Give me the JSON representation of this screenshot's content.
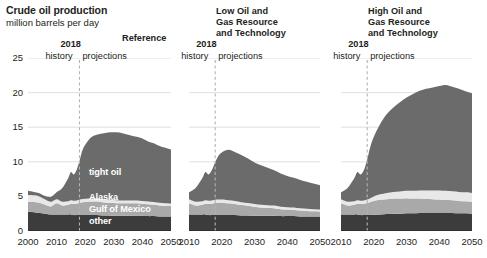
{
  "header": {
    "title": "Crude oil production",
    "subtitle": "million barrels per day"
  },
  "annotations": {
    "year_label": "2018",
    "history_label": "history",
    "projections_label": "projections"
  },
  "series_labels": {
    "tight_oil": "tight oil",
    "alaska": "Alaska",
    "gulf_of_mexico": "Gulf of Mexico",
    "other": "other"
  },
  "colors": {
    "tight_oil": "#6b6b6b",
    "alaska": "#e8e8e8",
    "gulf_of_mexico": "#a9a9a9",
    "other": "#3c3c3c",
    "axis": "#231f20",
    "gridline": "#d8d8d8",
    "divider": "#b4b4b4",
    "label_text": "#231f20",
    "series_label_text": "#ffffff"
  },
  "chart_data": [
    {
      "type": "area",
      "panel": "reference",
      "title": "Reference",
      "xlabel": "",
      "ylabel": "million barrels per day",
      "grid": true,
      "legend": "inline-series-labels",
      "xlim": [
        2000,
        2050
      ],
      "ylim": [
        0,
        25
      ],
      "xticks": [
        2000,
        2010,
        2020,
        2030,
        2040,
        2050
      ],
      "yticks": [
        0,
        5,
        10,
        15,
        20,
        25
      ],
      "divider_x": 2018,
      "stack_order": [
        "other",
        "gulf_of_mexico",
        "alaska",
        "tight_oil"
      ],
      "x": [
        2000,
        2002,
        2004,
        2006,
        2008,
        2010,
        2012,
        2014,
        2015,
        2016,
        2017,
        2018,
        2019,
        2020,
        2022,
        2024,
        2026,
        2028,
        2030,
        2032,
        2034,
        2036,
        2038,
        2040,
        2042,
        2044,
        2046,
        2048,
        2050
      ],
      "series": [
        {
          "name": "other",
          "values": [
            2.8,
            2.7,
            2.6,
            2.5,
            2.4,
            2.4,
            2.4,
            2.4,
            2.4,
            2.3,
            2.3,
            2.3,
            2.3,
            2.3,
            2.3,
            2.3,
            2.25,
            2.25,
            2.2,
            2.2,
            2.2,
            2.2,
            2.2,
            2.2,
            2.15,
            2.15,
            2.1,
            2.1,
            2.1
          ]
        },
        {
          "name": "gulf_of_mexico",
          "values": [
            1.4,
            1.5,
            1.5,
            1.3,
            1.15,
            1.6,
            1.3,
            1.4,
            1.55,
            1.6,
            1.65,
            1.75,
            1.85,
            1.9,
            1.95,
            1.95,
            1.9,
            1.85,
            1.85,
            1.8,
            1.8,
            1.8,
            1.8,
            1.75,
            1.7,
            1.65,
            1.6,
            1.55,
            1.5
          ]
        },
        {
          "name": "alaska",
          "values": [
            1.0,
            0.95,
            0.9,
            0.75,
            0.68,
            0.6,
            0.53,
            0.5,
            0.48,
            0.48,
            0.47,
            0.47,
            0.47,
            0.47,
            0.46,
            0.45,
            0.45,
            0.44,
            0.43,
            0.42,
            0.42,
            0.41,
            0.41,
            0.4,
            0.4,
            0.39,
            0.38,
            0.37,
            0.37
          ]
        },
        {
          "name": "tight_oil",
          "values": [
            0.6,
            0.5,
            0.45,
            0.5,
            0.7,
            1.0,
            2.0,
            3.3,
            4.1,
            3.8,
            4.4,
            5.6,
            7.0,
            7.8,
            8.8,
            9.2,
            9.5,
            9.7,
            9.8,
            9.8,
            9.6,
            9.4,
            9.2,
            9.0,
            8.7,
            8.5,
            8.2,
            8.0,
            7.8
          ]
        }
      ],
      "totals": [
        5.8,
        5.65,
        5.45,
        5.05,
        4.93,
        5.6,
        6.23,
        7.6,
        8.53,
        8.18,
        8.82,
        10.12,
        11.62,
        12.47,
        13.51,
        13.9,
        14.1,
        14.24,
        14.28,
        14.22,
        14.02,
        13.81,
        13.61,
        13.35,
        12.95,
        12.69,
        12.28,
        12.02,
        11.77
      ]
    },
    {
      "type": "area",
      "panel": "low_resource",
      "title": "Low Oil and\nGas Resource\nand Technology",
      "xlabel": "",
      "ylabel": "",
      "grid": true,
      "legend": "none",
      "xlim": [
        2010,
        2050
      ],
      "ylim": [
        0,
        25
      ],
      "xticks": [
        2010,
        2020,
        2030,
        2040,
        2050
      ],
      "yticks": [
        0,
        5,
        10,
        15,
        20,
        25
      ],
      "divider_x": 2018,
      "stack_order": [
        "other",
        "gulf_of_mexico",
        "alaska",
        "tight_oil"
      ],
      "x": [
        2010,
        2012,
        2014,
        2015,
        2016,
        2017,
        2018,
        2019,
        2020,
        2022,
        2024,
        2026,
        2028,
        2030,
        2032,
        2034,
        2036,
        2038,
        2040,
        2042,
        2044,
        2046,
        2048,
        2050
      ],
      "series": [
        {
          "name": "other",
          "values": [
            2.4,
            2.4,
            2.4,
            2.4,
            2.3,
            2.3,
            2.3,
            2.3,
            2.3,
            2.3,
            2.3,
            2.25,
            2.25,
            2.2,
            2.2,
            2.2,
            2.2,
            2.15,
            2.15,
            2.15,
            2.1,
            2.1,
            2.1,
            2.1
          ]
        },
        {
          "name": "gulf_of_mexico",
          "values": [
            1.6,
            1.3,
            1.4,
            1.55,
            1.6,
            1.65,
            1.75,
            1.8,
            1.8,
            1.7,
            1.6,
            1.5,
            1.4,
            1.3,
            1.2,
            1.15,
            1.1,
            1.0,
            0.95,
            0.9,
            0.85,
            0.8,
            0.75,
            0.72
          ]
        },
        {
          "name": "alaska",
          "values": [
            0.6,
            0.53,
            0.5,
            0.48,
            0.48,
            0.47,
            0.47,
            0.46,
            0.45,
            0.44,
            0.43,
            0.42,
            0.41,
            0.4,
            0.39,
            0.38,
            0.37,
            0.36,
            0.35,
            0.34,
            0.33,
            0.32,
            0.31,
            0.3
          ]
        },
        {
          "name": "tight_oil",
          "values": [
            1.0,
            2.0,
            3.3,
            4.1,
            3.8,
            4.4,
            5.4,
            6.3,
            6.8,
            7.3,
            7.1,
            6.8,
            6.4,
            6.0,
            5.7,
            5.4,
            5.1,
            4.8,
            4.5,
            4.3,
            4.1,
            3.9,
            3.7,
            3.5
          ]
        }
      ],
      "totals": [
        5.6,
        6.23,
        7.6,
        8.53,
        8.18,
        8.82,
        9.92,
        10.86,
        11.35,
        11.74,
        11.43,
        10.97,
        10.46,
        9.9,
        9.49,
        9.13,
        8.77,
        8.31,
        7.95,
        7.69,
        7.38,
        7.12,
        6.86,
        6.62
      ]
    },
    {
      "type": "area",
      "panel": "high_resource",
      "title": "High Oil and\nGas Resource\nand Technology",
      "xlabel": "",
      "ylabel": "",
      "grid": true,
      "legend": "none",
      "xlim": [
        2010,
        2050
      ],
      "ylim": [
        0,
        25
      ],
      "xticks": [
        2010,
        2020,
        2030,
        2040,
        2050
      ],
      "yticks": [
        0,
        5,
        10,
        15,
        20,
        25
      ],
      "divider_x": 2018,
      "stack_order": [
        "other",
        "gulf_of_mexico",
        "alaska",
        "tight_oil"
      ],
      "x": [
        2010,
        2012,
        2014,
        2015,
        2016,
        2017,
        2018,
        2019,
        2020,
        2022,
        2024,
        2026,
        2028,
        2030,
        2032,
        2034,
        2036,
        2038,
        2040,
        2042,
        2044,
        2046,
        2048,
        2050
      ],
      "series": [
        {
          "name": "other",
          "values": [
            2.4,
            2.4,
            2.4,
            2.4,
            2.3,
            2.3,
            2.3,
            2.3,
            2.35,
            2.4,
            2.45,
            2.5,
            2.5,
            2.55,
            2.55,
            2.6,
            2.6,
            2.6,
            2.6,
            2.6,
            2.6,
            2.55,
            2.55,
            2.5
          ]
        },
        {
          "name": "gulf_of_mexico",
          "values": [
            1.6,
            1.3,
            1.4,
            1.55,
            1.6,
            1.65,
            1.75,
            1.9,
            2.0,
            2.1,
            2.15,
            2.2,
            2.2,
            2.2,
            2.15,
            2.1,
            2.05,
            2.0,
            1.95,
            1.9,
            1.85,
            1.8,
            1.75,
            1.7
          ]
        },
        {
          "name": "alaska",
          "values": [
            0.6,
            0.53,
            0.5,
            0.48,
            0.48,
            0.47,
            0.5,
            0.55,
            0.65,
            0.8,
            0.9,
            0.95,
            1.0,
            1.05,
            1.1,
            1.15,
            1.2,
            1.25,
            1.3,
            1.3,
            1.3,
            1.3,
            1.3,
            1.3
          ]
        },
        {
          "name": "tight_oil",
          "values": [
            1.0,
            2.0,
            3.3,
            4.1,
            3.8,
            4.4,
            5.8,
            7.5,
            8.6,
            10.2,
            11.4,
            12.2,
            12.9,
            13.5,
            14.0,
            14.4,
            14.7,
            14.9,
            15.1,
            15.3,
            15.1,
            14.9,
            14.6,
            14.4
          ]
        }
      ],
      "totals": [
        5.6,
        6.23,
        7.6,
        8.53,
        8.18,
        8.82,
        10.35,
        12.25,
        13.6,
        15.5,
        16.9,
        17.85,
        18.6,
        19.3,
        19.8,
        20.25,
        20.55,
        20.75,
        20.95,
        21.1,
        20.85,
        20.55,
        20.2,
        19.9
      ]
    }
  ]
}
